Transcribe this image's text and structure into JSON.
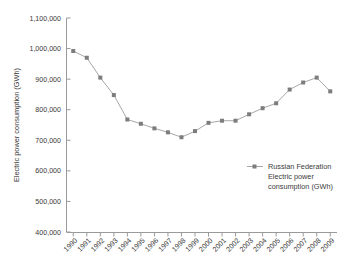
{
  "chart_data": {
    "type": "line",
    "title": "",
    "xlabel": "",
    "ylabel": "Electric power consumption (GWh)",
    "ylim": [
      400000,
      1100000
    ],
    "ytick_labels": [
      "1,100,000",
      "1,000,000",
      "900,000",
      "800,000",
      "700,000",
      "600,000",
      "500,000",
      "400,000"
    ],
    "ytick_values": [
      1100000,
      1000000,
      900000,
      800000,
      700000,
      600000,
      500000,
      400000
    ],
    "grid": false,
    "legend_position": "center-right",
    "categories": [
      "1990",
      "1991",
      "1992",
      "1993",
      "1994",
      "1995",
      "1996",
      "1997",
      "1998",
      "1999",
      "2000",
      "2001",
      "2002",
      "2003",
      "2004",
      "2005",
      "2006",
      "2007",
      "2008",
      "2009"
    ],
    "series": [
      {
        "name": "Russian Federation Electric power consumption (GWh)",
        "legend_lines": [
          "Russian Federation",
          "Electric power",
          "consumption (GWh)"
        ],
        "marker": "square",
        "color": "#a8a8a8",
        "marker_color": "#7d7d7d",
        "values": [
          992000,
          970000,
          905000,
          848000,
          768000,
          754000,
          739000,
          726000,
          710000,
          730000,
          757000,
          764000,
          764000,
          785000,
          805000,
          821000,
          866000,
          889000,
          905000,
          860000
        ]
      }
    ]
  }
}
